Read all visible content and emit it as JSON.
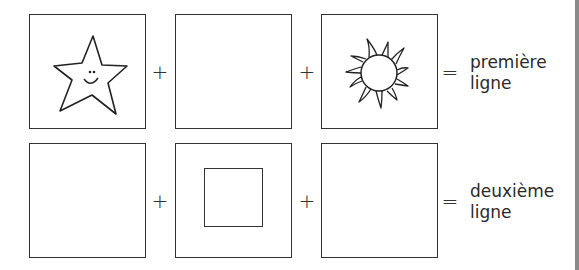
{
  "rows": [
    {
      "cells": [
        {
          "content": "star-with-smiley-face"
        },
        {
          "content": "empty"
        },
        {
          "content": "sun"
        }
      ],
      "operators": [
        "+",
        "+",
        "="
      ],
      "label_line1": "première",
      "label_line2": "ligne"
    },
    {
      "cells": [
        {
          "content": "empty"
        },
        {
          "content": "small-square"
        },
        {
          "content": "empty"
        }
      ],
      "operators": [
        "+",
        "+",
        "="
      ],
      "label_line1": "deuxième",
      "label_line2": "ligne"
    }
  ]
}
